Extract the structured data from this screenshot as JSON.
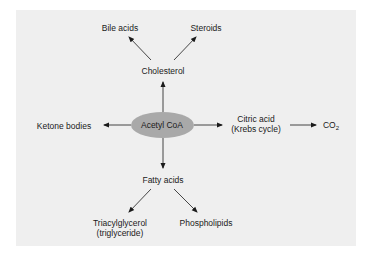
{
  "diagram": {
    "center": {
      "label": "Acetyl CoA",
      "fill": "#a9a9a9"
    },
    "nodes": {
      "bile_acids": "Bile acids",
      "steroids": "Steroids",
      "cholesterol": "Cholesterol",
      "ketone_bodies": "Ketone bodies",
      "citric_acid_line1": "Citric acid",
      "citric_acid_line2": "(Krebs cycle)",
      "co2_base": "CO",
      "co2_sub": "2",
      "fatty_acids": "Fatty acids",
      "triacylglycerol_line1": "Triacylglycerol",
      "triacylglycerol_line2": "(triglyceride)",
      "phospholipids": "Phospholipids"
    },
    "edges": [
      {
        "from": "Acetyl CoA",
        "to": "Cholesterol"
      },
      {
        "from": "Cholesterol",
        "to": "Bile acids"
      },
      {
        "from": "Cholesterol",
        "to": "Steroids"
      },
      {
        "from": "Acetyl CoA",
        "to": "Ketone bodies"
      },
      {
        "from": "Acetyl CoA",
        "to": "Citric acid (Krebs cycle)"
      },
      {
        "from": "Citric acid (Krebs cycle)",
        "to": "CO2"
      },
      {
        "from": "Acetyl CoA",
        "to": "Fatty acids"
      },
      {
        "from": "Fatty acids",
        "to": "Triacylglycerol (triglyceride)"
      },
      {
        "from": "Fatty acids",
        "to": "Phospholipids"
      }
    ],
    "colors": {
      "background": "#efefef",
      "arrow": "#1a1a1a"
    }
  }
}
